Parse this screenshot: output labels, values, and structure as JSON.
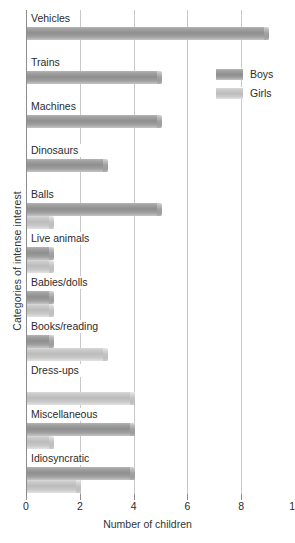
{
  "chart_data": {
    "type": "bar",
    "orientation": "horizontal",
    "title": "",
    "xlabel": "Number of children",
    "ylabel": "Categories of intense interest",
    "xlim": [
      0,
      10
    ],
    "xticks": [
      0,
      2,
      4,
      6,
      8,
      10
    ],
    "xtick_labels": [
      "0",
      "2",
      "4",
      "6",
      "8",
      "10"
    ],
    "grid": "vertical",
    "legend_position": "upper right",
    "categories": [
      "Vehicles",
      "Trains",
      "Machines",
      "Dinosaurs",
      "Balls",
      "Live animals",
      "Babies/dolls",
      "Books/reading",
      "Dress-ups",
      "Miscellaneous",
      "Idiosyncratic"
    ],
    "series": [
      {
        "name": "Boys",
        "color": "#969696",
        "values": [
          9,
          5,
          5,
          3,
          5,
          1,
          1,
          1,
          0,
          4,
          4
        ]
      },
      {
        "name": "Girls",
        "color": "#c4c4c4",
        "values": [
          0,
          0,
          0,
          0,
          1,
          1,
          1,
          3,
          4,
          1,
          2
        ]
      }
    ]
  },
  "legend": {
    "items": [
      {
        "label": "Boys",
        "swatch": "boys"
      },
      {
        "label": "Girls",
        "swatch": "girls"
      }
    ]
  }
}
